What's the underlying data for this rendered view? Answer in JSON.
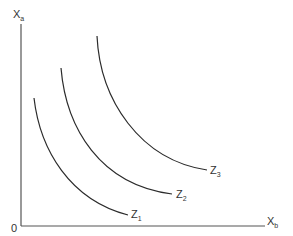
{
  "diagram": {
    "type": "indifference-curve-map",
    "y_axis": {
      "label": "X",
      "subscript": "a"
    },
    "x_axis": {
      "label": "X",
      "subscript": "b"
    },
    "origin_label": "0",
    "curves": [
      {
        "name": "Z",
        "subscript": "1"
      },
      {
        "name": "Z",
        "subscript": "2"
      },
      {
        "name": "Z",
        "subscript": "3"
      }
    ],
    "colors": {
      "axis": "#555555",
      "curve": "#2b2b2b",
      "text": "#333333",
      "background": "#ffffff"
    }
  }
}
